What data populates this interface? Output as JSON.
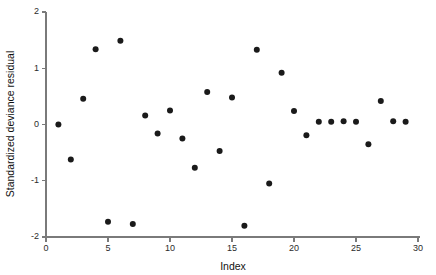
{
  "chart_data": {
    "type": "scatter",
    "title": "",
    "xlabel": "Index",
    "ylabel": "Standardized deviance residual",
    "xlim": [
      0,
      30
    ],
    "ylim": [
      -2,
      2
    ],
    "xticks": [
      0,
      5,
      10,
      15,
      20,
      25,
      30
    ],
    "xtick_labels": [
      "0",
      "5",
      "10",
      "15",
      "20",
      "25",
      "30"
    ],
    "yticks": [
      -2,
      -1,
      0,
      1,
      2
    ],
    "ytick_labels": [
      "-2",
      "-1",
      "0",
      "1",
      "2"
    ],
    "grid": false,
    "legend": null,
    "marker": "filled-circle",
    "marker_color": "#1a1a1a",
    "marker_size": 3,
    "x": [
      1,
      2,
      3,
      4,
      5,
      6,
      7,
      8,
      9,
      10,
      11,
      12,
      13,
      14,
      15,
      16,
      17,
      18,
      19,
      20,
      21,
      22,
      23,
      24,
      25,
      26,
      27,
      28,
      29
    ],
    "values": [
      0.0,
      -0.62,
      0.46,
      1.34,
      -1.73,
      1.49,
      -1.77,
      0.16,
      -0.16,
      0.25,
      -0.25,
      -0.77,
      0.58,
      -0.47,
      0.48,
      -1.8,
      1.33,
      -1.05,
      0.92,
      0.24,
      -0.19,
      0.05,
      0.05,
      0.06,
      0.05,
      -0.35,
      0.42,
      0.06,
      0.05
    ],
    "points": [
      {
        "index": 1,
        "residual": 0.0
      },
      {
        "index": 2,
        "residual": -0.62
      },
      {
        "index": 3,
        "residual": 0.46
      },
      {
        "index": 4,
        "residual": 1.34
      },
      {
        "index": 5,
        "residual": -1.73
      },
      {
        "index": 6,
        "residual": 1.49
      },
      {
        "index": 7,
        "residual": -1.77
      },
      {
        "index": 8,
        "residual": 0.16
      },
      {
        "index": 9,
        "residual": -0.16
      },
      {
        "index": 10,
        "residual": 0.25
      },
      {
        "index": 11,
        "residual": -0.25
      },
      {
        "index": 12,
        "residual": -0.77
      },
      {
        "index": 13,
        "residual": 0.58
      },
      {
        "index": 14,
        "residual": -0.47
      },
      {
        "index": 15,
        "residual": 0.48
      },
      {
        "index": 16,
        "residual": -1.8
      },
      {
        "index": 17,
        "residual": 1.33
      },
      {
        "index": 18,
        "residual": -1.05
      },
      {
        "index": 19,
        "residual": 0.92
      },
      {
        "index": 20,
        "residual": 0.24
      },
      {
        "index": 21,
        "residual": -0.19
      },
      {
        "index": 22,
        "residual": 0.05
      },
      {
        "index": 23,
        "residual": 0.05
      },
      {
        "index": 24,
        "residual": 0.06
      },
      {
        "index": 25,
        "residual": 0.05
      },
      {
        "index": 26,
        "residual": -0.35
      },
      {
        "index": 27,
        "residual": 0.42
      },
      {
        "index": 28,
        "residual": 0.06
      },
      {
        "index": 29,
        "residual": 0.05
      }
    ]
  }
}
